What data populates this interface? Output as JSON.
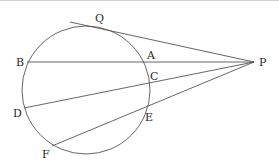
{
  "diagram": {
    "title": "",
    "circle": {
      "cx": 86,
      "cy": 90,
      "r": 64
    },
    "external_point": {
      "label": "P",
      "x": 254,
      "y": 62
    },
    "points": {
      "Q": {
        "label": "Q",
        "x": 101,
        "y": 28
      },
      "B": {
        "label": "B",
        "x": 27,
        "y": 62
      },
      "A": {
        "label": "A",
        "x": 146,
        "y": 62
      },
      "C": {
        "label": "C",
        "x": 149,
        "y": 81
      },
      "D": {
        "label": "D",
        "x": 24,
        "y": 108
      },
      "E": {
        "label": "E",
        "x": 145,
        "y": 110
      },
      "F": {
        "label": "F",
        "x": 52,
        "y": 146
      }
    },
    "segments": [
      {
        "name": "tangent-PQ",
        "from": "P",
        "to": "Q",
        "extends_beyond": true
      },
      {
        "name": "secant-PAB",
        "from": "P",
        "to": "B"
      },
      {
        "name": "secant-PCD",
        "from": "P",
        "to": "D"
      },
      {
        "name": "secant-PEF",
        "from": "P",
        "to": "F"
      }
    ],
    "labels": {
      "Q": "Q",
      "B": "B",
      "A": "A",
      "C": "C",
      "D": "D",
      "E": "E",
      "F": "F",
      "P": "P"
    }
  }
}
